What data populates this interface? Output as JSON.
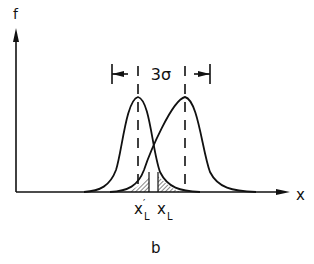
{
  "figure": {
    "panel_label": "b",
    "y_axis_label": "f",
    "x_axis_label": "x",
    "dimension_label": "3σ",
    "lower_limit_labels": {
      "left": {
        "base": "x",
        "prime": "′",
        "subscript": "L"
      },
      "right": {
        "base": "x",
        "subscript": "L"
      }
    }
  },
  "diagram": {
    "type": "two normal distribution curves shifted by 3σ",
    "curves": [
      {
        "name": "left-distribution",
        "peak_x": 138
      },
      {
        "name": "right-distribution",
        "peak_x": 185
      }
    ],
    "separation": "3σ",
    "shaded_regions": [
      "tail left of x'_L",
      "tail left of x_L"
    ],
    "colors": {
      "ink": "#111111",
      "background": "#ffffff"
    }
  }
}
